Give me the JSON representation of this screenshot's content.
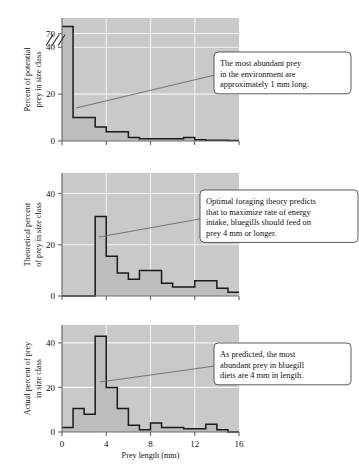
{
  "figure": {
    "xlabel": "Prey length (mm)",
    "x_ticks": [
      "0",
      "4",
      "8",
      "12",
      "16"
    ],
    "x_tick_values": [
      0,
      4,
      8,
      12,
      16
    ],
    "xlim": [
      0,
      16
    ]
  },
  "panels": [
    {
      "id": "potential-prey",
      "ylabel_line1": "Percent of potential",
      "ylabel_line2": "prey in size class",
      "y_ticks": [
        "0",
        "20",
        "40",
        "70"
      ],
      "y_tick_values": [
        0,
        20,
        40,
        70
      ],
      "axis_break": true,
      "callout": {
        "lines": [
          "The most abundant prey",
          "in the environment are",
          "approximately 1 mm long."
        ]
      }
    },
    {
      "id": "theoretical-prey",
      "ylabel_line1": "Theoretical percent",
      "ylabel_line2": "of prey in size class",
      "y_ticks": [
        "0",
        "20",
        "40"
      ],
      "y_tick_values": [
        0,
        20,
        40
      ],
      "axis_break": false,
      "callout": {
        "lines": [
          "Optimal foraging theory predicts",
          "that to maximize rate of energy",
          "intake, bluegills should feed on",
          "prey 4 mm or longer."
        ]
      }
    },
    {
      "id": "actual-prey",
      "ylabel_line1": "Actual percent of prey",
      "ylabel_line2": "in size class",
      "y_ticks": [
        "0",
        "20",
        "40"
      ],
      "y_tick_values": [
        0,
        20,
        40
      ],
      "axis_break": false,
      "callout": {
        "lines": [
          "As predicted, the most",
          "abundant prey in bluegill",
          "diets are 4 mm in length."
        ]
      }
    }
  ],
  "chart_data": [
    {
      "type": "bar",
      "title": "Percent of potential prey in size class",
      "xlabel": "Prey length (mm)",
      "ylabel": "Percent of potential prey in size class",
      "xlim": [
        0,
        16
      ],
      "ylim": [
        0,
        75
      ],
      "y_axis_broken_between": [
        42,
        68
      ],
      "grid": true,
      "bin_width": 1,
      "categories": [
        "0-1",
        "1-2",
        "2-3",
        "3-4",
        "4-5",
        "5-6",
        "6-7",
        "7-8",
        "8-9",
        "9-10",
        "10-11",
        "11-12",
        "12-13",
        "13-14",
        "14-15",
        "15-16"
      ],
      "values": [
        72,
        10,
        10,
        6,
        4,
        4,
        1.5,
        1,
        1,
        1,
        1,
        1.5,
        0.5,
        0.3,
        0.3,
        0.2
      ],
      "annotation": "The most abundant prey in the environment are approximately 1 mm long."
    },
    {
      "type": "bar",
      "title": "Theoretical percent of prey in size class",
      "xlabel": "Prey length (mm)",
      "ylabel": "Theoretical percent of prey in size class",
      "xlim": [
        0,
        16
      ],
      "ylim": [
        0,
        48
      ],
      "grid": true,
      "bin_width": 1,
      "categories": [
        "0-1",
        "1-2",
        "2-3",
        "3-4",
        "4-5",
        "5-6",
        "6-7",
        "7-8",
        "8-9",
        "9-10",
        "10-11",
        "11-12",
        "12-13",
        "13-14",
        "14-15",
        "15-16"
      ],
      "values": [
        0,
        0,
        0,
        31,
        15.5,
        9,
        6.5,
        10,
        10,
        5,
        3.5,
        3.5,
        6,
        6,
        3,
        1.5
      ],
      "annotation": "Optimal foraging theory predicts that to maximize rate of energy intake, bluegills should feed on prey 4 mm or longer."
    },
    {
      "type": "bar",
      "title": "Actual percent of prey in size class",
      "xlabel": "Prey length (mm)",
      "ylabel": "Actual percent of prey in size class",
      "xlim": [
        0,
        16
      ],
      "ylim": [
        0,
        48
      ],
      "grid": true,
      "bin_width": 1,
      "categories": [
        "0-1",
        "1-2",
        "2-3",
        "3-4",
        "4-5",
        "5-6",
        "6-7",
        "7-8",
        "8-9",
        "9-10",
        "10-11",
        "11-12",
        "12-13",
        "13-14",
        "14-15",
        "15-16"
      ],
      "values": [
        2,
        10.5,
        8,
        43,
        20,
        10.5,
        3,
        1,
        4,
        2,
        2,
        1.5,
        1.5,
        3.5,
        1,
        0
      ],
      "annotation": "As predicted, the most abundant prey in bluegill diets are 4 mm in length."
    }
  ]
}
